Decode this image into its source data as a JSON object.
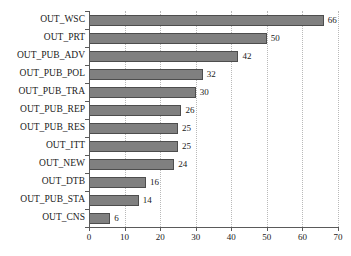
{
  "chart_data": {
    "type": "bar",
    "orientation": "horizontal",
    "title": "",
    "xlabel": "",
    "ylabel": "",
    "xlim": [
      0,
      70
    ],
    "xticks": [
      0,
      10,
      20,
      30,
      40,
      50,
      60,
      70
    ],
    "grid": "vertical-dotted",
    "legend": "none",
    "categories": [
      "OUT_WSC",
      "OUT_PRT",
      "OUT_PUB_ADV",
      "OUT_PUB_POL",
      "OUT_PUB_TRA",
      "OUT_PUB_REP",
      "OUT_PUB_RES",
      "OUT_ITT",
      "OUT_NEW",
      "OUT_DTB",
      "OUT_PUB_STA",
      "OUT_CNS"
    ],
    "values": [
      66,
      50,
      42,
      32,
      30,
      26,
      25,
      25,
      24,
      16,
      14,
      6
    ],
    "value_labels": [
      "66",
      "50",
      "42",
      "32",
      "30",
      "26",
      "25",
      "25",
      "24",
      "16",
      "14",
      "6"
    ],
    "tick_labels": [
      "0",
      "10",
      "20",
      "30",
      "40",
      "50",
      "60",
      "70"
    ],
    "colors": {
      "bar_fill": "#808080",
      "bar_border": "#4d4d4d",
      "axis": "#5a5a5a",
      "gridline": "#b9b9b9",
      "background": "#ffffff",
      "text": "#1a1a1a"
    }
  }
}
